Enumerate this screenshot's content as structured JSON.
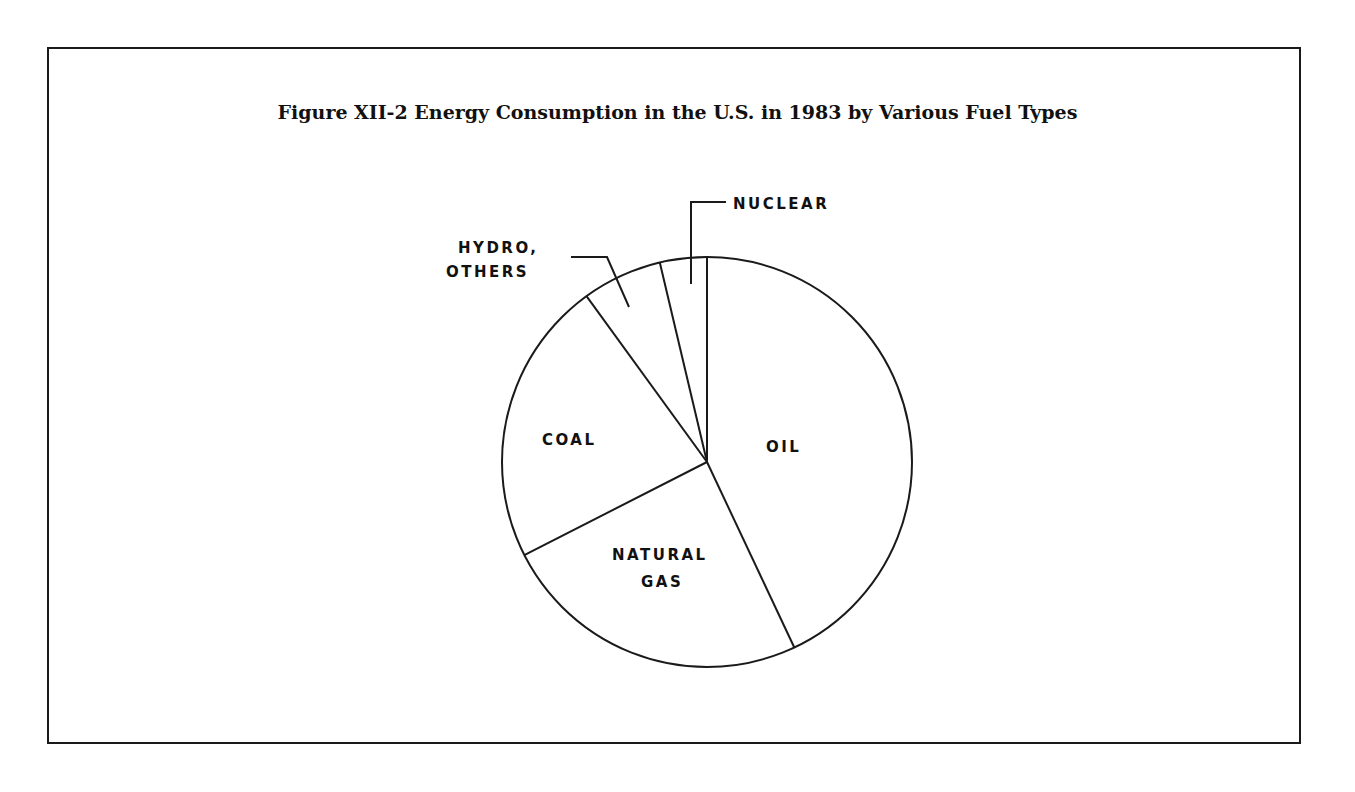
{
  "figure": {
    "title": "Figure XII-2  Energy Consumption in the U.S. in 1983 by Various Fuel Types"
  },
  "chart_data": {
    "type": "pie",
    "title": "Figure XII-2 Energy Consumption in the U.S. in 1983 by Various Fuel Types",
    "categories": [
      "Oil",
      "Natural Gas",
      "Coal",
      "Hydro, Others",
      "Nuclear"
    ],
    "values": [
      43,
      24.5,
      22.5,
      6.3,
      3.7
    ],
    "unit": "percent (estimated from slice angles)",
    "labels": {
      "oil": "OIL",
      "natural_gas_line1": "NATURAL",
      "natural_gas_line2": "GAS",
      "coal": "COAL",
      "hydro_line1": "HYDRO,",
      "hydro_line2": "OTHERS",
      "nuclear": "NUCLEAR"
    },
    "start_angle_deg": 0,
    "direction": "clockwise",
    "legend": "none (direct labels with leader lines)"
  }
}
